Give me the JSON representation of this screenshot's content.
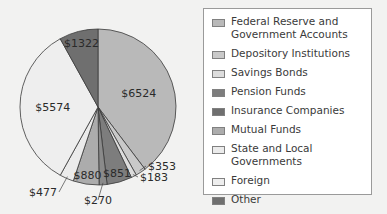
{
  "chart_data": {
    "type": "pie",
    "title": "",
    "start_angle_deg": 0,
    "direction": "clockwise",
    "unit_prefix": "$",
    "categories": [
      "Federal Reserve and Government Accounts",
      "Depository Institutions",
      "Savings Bonds",
      "Pension Funds",
      "Insurance Companies",
      "Mutual Funds",
      "State and Local Governments",
      "Foreign",
      "Other"
    ],
    "values": [
      6524,
      353,
      183,
      851,
      270,
      880,
      477,
      5574,
      1322
    ],
    "labels": [
      "$6524",
      "$353",
      "$183",
      "$851",
      "$270",
      "$880",
      "$477",
      "$5574",
      "$1322"
    ],
    "colors": [
      "#b9b9b9",
      "#c9c9c9",
      "#dcdcdc",
      "#7d7d7d",
      "#8a8a8a",
      "#acacac",
      "#ebebeb",
      "#eeeeee",
      "#6f6f6f"
    ],
    "legend_position": "right"
  },
  "legend": {
    "items": [
      {
        "label": "Federal Reserve and Government Accounts",
        "color": "#b9b9b9"
      },
      {
        "label": "Depository Institutions",
        "color": "#c9c9c9"
      },
      {
        "label": "Savings Bonds",
        "color": "#dcdcdc"
      },
      {
        "label": "Pension Funds",
        "color": "#7d7d7d"
      },
      {
        "label": "Insurance Companies",
        "color": "#6f6f6f"
      },
      {
        "label": "Mutual Funds",
        "color": "#acacac"
      },
      {
        "label": "State and Local Governments",
        "color": "#ebebeb"
      },
      {
        "label": "Foreign",
        "color": "#eeeeee"
      },
      {
        "label": "Other",
        "color": "#6f6f6f"
      }
    ]
  }
}
